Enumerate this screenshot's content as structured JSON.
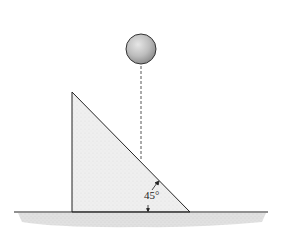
{
  "diagram": {
    "angle_label": "45°",
    "colors": {
      "ball_fill": "#bdbdbd",
      "ball_stroke": "#333333",
      "wedge_fill": "#eeeeee",
      "wedge_stroke": "#222222",
      "ground_fill": "#d9d9d9",
      "dashed_line": "#555555"
    }
  }
}
